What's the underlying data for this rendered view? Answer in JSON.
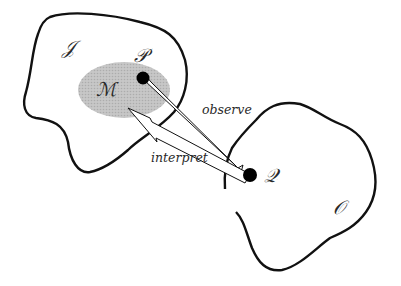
{
  "diagram": {
    "type": "conceptual",
    "sets": [
      {
        "id": "I",
        "label": "𝒥",
        "role": "interpretation space"
      },
      {
        "id": "O",
        "label": "𝒪",
        "role": "observation space"
      }
    ],
    "regions": [
      {
        "id": "M",
        "label": "ℳ",
        "parent": "I",
        "style": "shaded ellipse"
      }
    ],
    "points": [
      {
        "id": "P",
        "label": "𝒫",
        "parent": "M"
      },
      {
        "id": "Q",
        "label": "𝒬",
        "parent": "O"
      }
    ],
    "arrows": [
      {
        "id": "observe",
        "from": "P",
        "to": "Q",
        "label": "observe"
      },
      {
        "id": "interpret",
        "from": "Q",
        "to": "M",
        "label": "interpret"
      }
    ],
    "colors": {
      "outline": "#111111",
      "shade": "#bdbdbd",
      "point": "#000000",
      "arrow_fill": "#ffffff"
    }
  }
}
